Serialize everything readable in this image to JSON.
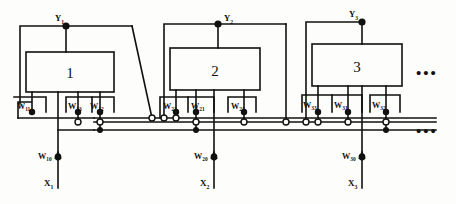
{
  "diagram": {
    "blocks": [
      {
        "label": "1",
        "output": "Y",
        "output_sub": "1",
        "weights": [
          {
            "name": "W",
            "sub": "11"
          },
          {
            "name": "W",
            "sub": "13"
          },
          {
            "name": "W",
            "sub": "12"
          }
        ],
        "bias": {
          "name": "W",
          "sub": "10"
        },
        "input": {
          "name": "X",
          "sub": "1"
        }
      },
      {
        "label": "2",
        "output": "Y",
        "output_sub": "2",
        "weights": [
          {
            "name": "W",
            "sub": "22"
          },
          {
            "name": "W",
            "sub": "21"
          },
          {
            "name": "W",
            "sub": "23"
          }
        ],
        "bias": {
          "name": "W",
          "sub": "20"
        },
        "input": {
          "name": "X",
          "sub": "2"
        }
      },
      {
        "label": "3",
        "output": "Y",
        "output_sub": "3",
        "weights": [
          {
            "name": "W",
            "sub": "33"
          },
          {
            "name": "W",
            "sub": "31"
          },
          {
            "name": "W",
            "sub": "32"
          }
        ],
        "bias": {
          "name": "W",
          "sub": "30"
        },
        "input": {
          "name": "X",
          "sub": "3"
        }
      }
    ],
    "ellipsis_top": "• • •",
    "ellipsis_bus": "• • •",
    "colors": {
      "ink": "#111111",
      "paper": "#fdfdfb"
    }
  }
}
